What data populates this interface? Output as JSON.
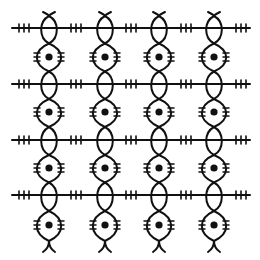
{
  "illustration": {
    "title": "Braided chain lattice pattern",
    "width": 260,
    "height": 260,
    "background": "#ffffff",
    "ink": "#111111",
    "stroke_width": 2,
    "columns_x": [
      49,
      105,
      159,
      214
    ],
    "rows": {
      "horizontal_lines_y": [
        28,
        84,
        140,
        195
      ],
      "dots_y": [
        57,
        112,
        168,
        225
      ]
    },
    "horizontal_line": {
      "x_start": 12,
      "x_end": 250,
      "ticks_per_group": 3,
      "tick_half_height": 4,
      "tick_spacing": 5
    },
    "tick_groups_x": [
      24,
      76,
      131,
      186,
      241
    ],
    "strand": {
      "y_top": 12,
      "y_bottom": 252,
      "narrow_half_width": 8,
      "wide_half_width": 12
    },
    "dot": {
      "radius": 3.6
    },
    "lens_ticks": {
      "count_per_side": 3,
      "length": 6,
      "spacing": 4
    }
  }
}
